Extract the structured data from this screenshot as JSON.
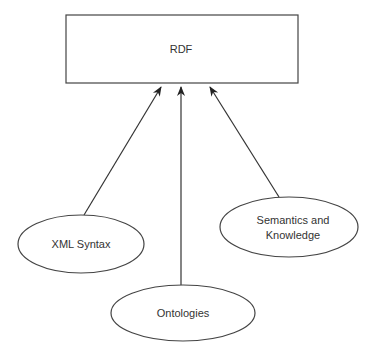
{
  "diagram": {
    "type": "dependency-diagram",
    "nodes": [
      {
        "id": "rdf",
        "label": "RDF",
        "shape": "rectangle"
      },
      {
        "id": "xml",
        "label": "XML Syntax",
        "shape": "ellipse"
      },
      {
        "id": "ontologies",
        "label": "Ontologies",
        "shape": "ellipse"
      },
      {
        "id": "semantics",
        "label_line1": "Semantics and",
        "label_line2": "Knowledge",
        "shape": "ellipse"
      }
    ],
    "edges": [
      {
        "from": "xml",
        "to": "rdf",
        "arrow": "head-at-target"
      },
      {
        "from": "ontologies",
        "to": "rdf",
        "arrow": "head-at-target"
      },
      {
        "from": "semantics",
        "to": "rdf",
        "arrow": "head-at-target"
      }
    ],
    "colors": {
      "stroke": "#444444",
      "text": "#333333",
      "background": "#ffffff"
    }
  }
}
